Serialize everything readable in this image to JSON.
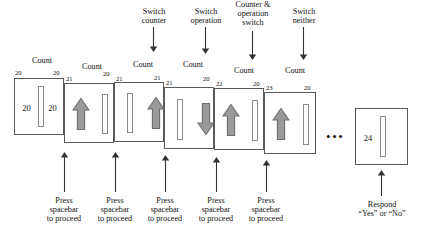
{
  "diagram": {
    "title_labels": [
      {
        "text": "Switch\ncounter",
        "x": 128,
        "y": 7,
        "w": 52
      },
      {
        "text": "Switch\noperation",
        "x": 177,
        "y": 7,
        "w": 58
      },
      {
        "text": "Counter &\noperation\nswitch",
        "x": 224,
        "y": 0,
        "w": 58
      },
      {
        "text": "Switch\nneither",
        "x": 278,
        "y": 7,
        "w": 52
      }
    ],
    "count_labels": [
      {
        "text": "Count",
        "x": 20,
        "y": 56,
        "w": 44
      },
      {
        "text": "Count",
        "x": 70,
        "y": 62,
        "w": 44
      },
      {
        "text": "Count",
        "x": 121,
        "y": 60,
        "w": 44
      },
      {
        "text": "Count",
        "x": 171,
        "y": 60,
        "w": 44
      },
      {
        "text": "Count",
        "x": 222,
        "y": 66,
        "w": 44
      },
      {
        "text": "Count",
        "x": 273,
        "y": 66,
        "w": 44
      }
    ],
    "cards": [
      {
        "name": "trial-card-1",
        "x": 14,
        "y": 78,
        "w": 50,
        "h": 57,
        "corner_left": "20",
        "corner_right": "20",
        "corner_left_x": 15,
        "corner_left_y": 70,
        "corner_right_x": 53,
        "corner_right_y": 70,
        "left_content": {
          "type": "number",
          "value": "20"
        },
        "right_content": {
          "type": "number",
          "value": "20"
        },
        "bar": true
      },
      {
        "name": "trial-card-2",
        "x": 64,
        "y": 83,
        "w": 50,
        "h": 60,
        "corner_left": "21",
        "corner_right": "20",
        "corner_left_x": 66,
        "corner_left_y": 76,
        "corner_right_x": 103,
        "corner_right_y": 71,
        "left_content": {
          "type": "arrow",
          "value": "up"
        },
        "right_content": {
          "type": "bar",
          "value": ""
        },
        "bar": false
      },
      {
        "name": "trial-card-3",
        "x": 114,
        "y": 82,
        "w": 50,
        "h": 60,
        "corner_left": "21",
        "corner_right": "21",
        "corner_left_x": 116,
        "corner_left_y": 76,
        "corner_right_x": 154,
        "corner_right_y": 75,
        "left_content": {
          "type": "bar",
          "value": ""
        },
        "right_content": {
          "type": "arrow",
          "value": "up"
        },
        "bar": false
      },
      {
        "name": "trial-card-4",
        "x": 164,
        "y": 87,
        "w": 50,
        "h": 62,
        "corner_left": "21",
        "corner_right": "20",
        "corner_left_x": 166,
        "corner_left_y": 80,
        "corner_right_x": 203,
        "corner_right_y": 76,
        "left_content": {
          "type": "bar",
          "value": ""
        },
        "right_content": {
          "type": "arrow",
          "value": "down"
        },
        "bar": false
      },
      {
        "name": "trial-card-5",
        "x": 214,
        "y": 88,
        "w": 50,
        "h": 62,
        "corner_left": "22",
        "corner_right": "20",
        "corner_left_x": 216,
        "corner_left_y": 81,
        "corner_right_x": 253,
        "corner_right_y": 81,
        "left_content": {
          "type": "arrow",
          "value": "up"
        },
        "right_content": {
          "type": "bar",
          "value": ""
        },
        "bar": false
      },
      {
        "name": "trial-card-6",
        "x": 264,
        "y": 92,
        "w": 52,
        "h": 62,
        "corner_left": "23",
        "corner_right": "20",
        "corner_left_x": 266,
        "corner_left_y": 85,
        "corner_right_x": 304,
        "corner_right_y": 85,
        "left_content": {
          "type": "arrow",
          "value": "up"
        },
        "right_content": {
          "type": "bar",
          "value": ""
        },
        "bar": false
      },
      {
        "name": "response-card",
        "x": 355,
        "y": 108,
        "w": 53,
        "h": 57,
        "corner_left": "",
        "corner_right": "",
        "corner_left_x": 0,
        "corner_left_y": 0,
        "corner_right_x": 0,
        "corner_right_y": 0,
        "left_content": {
          "type": "number",
          "value": "24"
        },
        "right_content": {
          "type": "none",
          "value": ""
        },
        "bar": true
      }
    ],
    "ellipsis": {
      "text": "•••",
      "x": 326,
      "y": 130
    },
    "bottom_labels": [
      {
        "text": "Press\nspacebar\nto proceed",
        "x": 38,
        "y": 196,
        "w": 52,
        "arrow_x": 64,
        "arrow_top": 152,
        "arrow_bottom": 192
      },
      {
        "text": "Press\nspacebar\nto proceed",
        "x": 89,
        "y": 196,
        "w": 52,
        "arrow_x": 115,
        "arrow_top": 152,
        "arrow_bottom": 192
      },
      {
        "text": "Press\nspacebar\nto proceed",
        "x": 139,
        "y": 196,
        "w": 52,
        "arrow_x": 165,
        "arrow_top": 155,
        "arrow_bottom": 192
      },
      {
        "text": "Press\nspacebar\nto proceed",
        "x": 190,
        "y": 196,
        "w": 52,
        "arrow_x": 216,
        "arrow_top": 157,
        "arrow_bottom": 192
      },
      {
        "text": "Press\nspacebar\nto proceed",
        "x": 240,
        "y": 196,
        "w": 52,
        "arrow_x": 266,
        "arrow_top": 160,
        "arrow_bottom": 192
      },
      {
        "text": "Respond\n“Yes” or “No”",
        "x": 346,
        "y": 200,
        "w": 72,
        "arrow_x": 381,
        "arrow_top": 170,
        "arrow_bottom": 196
      }
    ],
    "top_connectors": [
      {
        "x": 153,
        "top": 27,
        "bottom": 52
      },
      {
        "x": 205,
        "top": 27,
        "bottom": 54
      },
      {
        "x": 252,
        "top": 31,
        "bottom": 60
      },
      {
        "x": 303,
        "top": 27,
        "bottom": 60
      }
    ],
    "colors": {
      "card_border": "#5a5a5a",
      "bar_border": "#8a8a8a",
      "arrow_fill": "#9a9a9a",
      "arrow_stroke": "#6e6e6e",
      "text": "#111111",
      "line": "#333333",
      "background": "#ffffff"
    }
  }
}
